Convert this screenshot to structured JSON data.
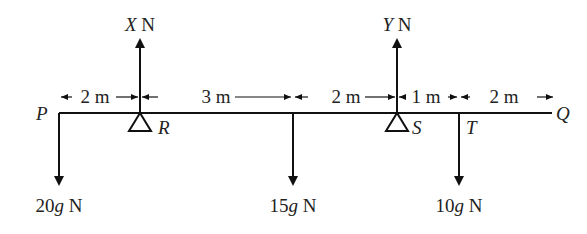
{
  "diagram": {
    "beam": {
      "left_label": "P",
      "right_label": "Q"
    },
    "supports": [
      {
        "label": "R",
        "reaction_var": "X",
        "reaction_unit": " N"
      },
      {
        "label": "S",
        "reaction_var": "Y",
        "reaction_unit": " N"
      }
    ],
    "points": [
      {
        "label": "T"
      }
    ],
    "loads": [
      {
        "coef": "20",
        "g": "g",
        "unit": " N"
      },
      {
        "coef": "15",
        "g": "g",
        "unit": " N"
      },
      {
        "coef": "10",
        "g": "g",
        "unit": " N"
      }
    ],
    "dimensions": [
      "2 m",
      "3 m",
      "2 m",
      "1 m",
      "2 m"
    ]
  }
}
